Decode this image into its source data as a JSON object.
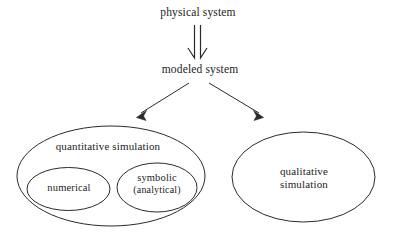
{
  "diagram": {
    "background_color": "#ffffff",
    "stroke_color": "#2a2a2a",
    "text_color": "#1c1c1c",
    "nodes": {
      "physical_system": "physical system",
      "modeled_system": "modeled system",
      "quantitative_simulation": "quantitative simulation",
      "numerical": "numerical",
      "symbolic_line1": "symbolic",
      "symbolic_line2": "(analytical)",
      "qualitative_line1": "qualitative",
      "qualitative_line2": "simulation"
    },
    "connectors": [
      {
        "name": "physical-to-modeled-arrow",
        "from": "physical system",
        "to": "modeled system",
        "style": "hollow-double-line-arrow",
        "direction": "down"
      },
      {
        "name": "modeled-to-quantitative-arrow",
        "from": "modeled system",
        "to": "quantitative simulation",
        "style": "solid-line-arrow",
        "direction": "down-left"
      },
      {
        "name": "modeled-to-qualitative-arrow",
        "from": "modeled system",
        "to": "qualitative simulation",
        "style": "solid-line-arrow",
        "direction": "down-right"
      }
    ],
    "groups": [
      {
        "name": "quantitative-simulation-ellipse",
        "label": "quantitative simulation",
        "children": [
          "numerical",
          "symbolic (analytical)"
        ]
      },
      {
        "name": "qualitative-simulation-ellipse",
        "label": "qualitative simulation",
        "children": []
      }
    ]
  }
}
